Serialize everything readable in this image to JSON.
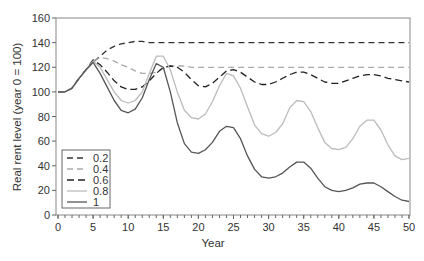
{
  "chart_data": {
    "type": "line",
    "title": "",
    "xlabel": "Year",
    "ylabel": "Real rent level (year 0 = 100)",
    "xlim": [
      0,
      50
    ],
    "ylim": [
      0,
      160
    ],
    "xticks": [
      0,
      5,
      10,
      15,
      20,
      25,
      30,
      35,
      40,
      45,
      50
    ],
    "yticks": [
      0,
      20,
      40,
      60,
      80,
      100,
      120,
      140,
      160
    ],
    "grid": false,
    "legend_position": "lower-left",
    "x": [
      0,
      1,
      2,
      3,
      4,
      5,
      6,
      7,
      8,
      9,
      10,
      11,
      12,
      13,
      14,
      15,
      16,
      17,
      18,
      19,
      20,
      21,
      22,
      23,
      24,
      25,
      26,
      27,
      28,
      29,
      30,
      31,
      32,
      33,
      34,
      35,
      36,
      37,
      38,
      39,
      40,
      41,
      42,
      43,
      44,
      45,
      46,
      47,
      48,
      49,
      50
    ],
    "series": [
      {
        "name": "0.2",
        "color": "#333333",
        "dash": "6,4",
        "values": [
          100,
          100,
          103,
          111,
          118,
          124,
          129,
          134,
          137,
          139,
          140,
          141,
          141,
          140,
          140,
          140,
          140,
          140,
          140,
          140,
          140,
          140,
          140,
          140,
          140,
          140,
          140,
          140,
          140,
          140,
          140,
          140,
          140,
          140,
          140,
          140,
          140,
          140,
          140,
          140,
          140,
          140,
          140,
          140,
          140,
          140,
          140,
          140,
          140,
          140,
          140
        ]
      },
      {
        "name": "0.4",
        "color": "#aaaaaa",
        "dash": "6,4",
        "values": [
          100,
          100,
          103,
          111,
          118,
          125,
          128,
          127,
          125,
          122,
          120,
          117,
          115,
          115,
          116,
          119,
          121,
          121,
          121,
          120,
          120,
          120,
          120,
          120,
          120,
          120,
          120,
          120,
          120,
          120,
          120,
          120,
          120,
          120,
          120,
          120,
          120,
          120,
          120,
          120,
          120,
          120,
          120,
          120,
          120,
          120,
          120,
          120,
          120,
          120,
          120
        ]
      },
      {
        "name": "0.6",
        "color": "#222222",
        "dash": "7,4",
        "values": [
          100,
          100,
          103,
          111,
          118,
          126,
          122,
          116,
          109,
          104,
          102,
          102,
          104,
          109,
          115,
          120,
          121,
          120,
          116,
          110,
          105,
          104,
          107,
          112,
          117,
          118,
          116,
          112,
          108,
          106,
          106,
          108,
          111,
          114,
          116,
          116,
          114,
          111,
          108,
          107,
          107,
          109,
          111,
          113,
          114,
          114,
          113,
          111,
          110,
          109,
          108
        ]
      },
      {
        "name": "0.8",
        "color": "#bbbbbb",
        "dash": "",
        "values": [
          100,
          100,
          103,
          111,
          118,
          125,
          120,
          110,
          100,
          93,
          91,
          93,
          100,
          115,
          129,
          129,
          118,
          100,
          85,
          79,
          78,
          82,
          92,
          105,
          115,
          113,
          103,
          88,
          73,
          66,
          64,
          67,
          74,
          87,
          93,
          92,
          84,
          71,
          59,
          54,
          53,
          55,
          62,
          72,
          77,
          77,
          69,
          57,
          48,
          45,
          46
        ]
      },
      {
        "name": "1",
        "color": "#555555",
        "dash": "",
        "values": [
          100,
          100,
          103,
          111,
          118,
          124,
          115,
          104,
          93,
          85,
          83,
          86,
          95,
          110,
          123,
          120,
          100,
          75,
          58,
          51,
          50,
          53,
          59,
          68,
          72,
          71,
          62,
          48,
          37,
          31,
          30,
          31,
          34,
          39,
          43,
          43,
          38,
          30,
          23,
          20,
          19,
          20,
          22,
          25,
          26,
          26,
          23,
          19,
          15,
          12,
          11
        ]
      }
    ]
  },
  "legend": {
    "items": [
      "0.2",
      "0.4",
      "0.6",
      "0.8",
      "1"
    ]
  },
  "axes": {
    "xlabel": "Year",
    "ylabel": "Real rent level (year 0 = 100)"
  }
}
